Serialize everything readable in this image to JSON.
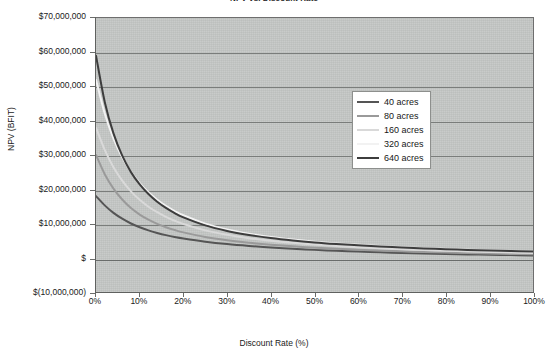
{
  "chart_data": {
    "type": "line",
    "title": "NPV vs. Discount Rate",
    "xlabel": "Discount Rate (%)",
    "ylabel": "NPV (BFIT)",
    "xlim": [
      0,
      100
    ],
    "ylim": [
      -10000000,
      70000000
    ],
    "grid": true,
    "legend_position": "upper-right-inside",
    "x_tick_labels": [
      "0%",
      "10%",
      "20%",
      "30%",
      "40%",
      "50%",
      "60%",
      "70%",
      "80%",
      "90%",
      "100%"
    ],
    "x_ticks": [
      0,
      10,
      20,
      30,
      40,
      50,
      60,
      70,
      80,
      90,
      100
    ],
    "y_tick_labels": [
      "$70,000,000",
      "$60,000,000",
      "$50,000,000",
      "$40,000,000",
      "$30,000,000",
      "$20,000,000",
      "$10,000,000",
      "$",
      "$(10,000,000)"
    ],
    "y_ticks": [
      70000000,
      60000000,
      50000000,
      40000000,
      30000000,
      20000000,
      10000000,
      0,
      -10000000
    ],
    "x": [
      0,
      2,
      4,
      6,
      8,
      10,
      12,
      14,
      16,
      18,
      20,
      25,
      30,
      35,
      40,
      45,
      50,
      55,
      60,
      65,
      70,
      75,
      80,
      85,
      90,
      95,
      100
    ],
    "series": [
      {
        "name": "40 acres",
        "color": "#555555",
        "values": [
          18000000,
          15300000,
          13100000,
          11400000,
          10000000,
          8900000,
          8000000,
          7250000,
          6600000,
          6050000,
          5600000,
          4700000,
          4000000,
          3450000,
          3000000,
          2630000,
          2300000,
          2030000,
          1800000,
          1590000,
          1410000,
          1250000,
          1110000,
          980000,
          870000,
          770000,
          680000
        ]
      },
      {
        "name": "80 acres",
        "color": "#9a9a9a",
        "values": [
          30000000,
          24400000,
          20200000,
          17000000,
          14500000,
          12600000,
          11100000,
          9900000,
          8900000,
          8100000,
          7400000,
          6050000,
          5100000,
          4370000,
          3800000,
          3330000,
          2940000,
          2610000,
          2330000,
          2090000,
          1870000,
          1680000,
          1510000,
          1360000,
          1220000,
          1100000,
          990000
        ]
      },
      {
        "name": "160 acres",
        "color": "#d9d9d9",
        "values": [
          38000000,
          31500000,
          26400000,
          22500000,
          19400000,
          16900000,
          14900000,
          13300000,
          11950000,
          10800000,
          9850000,
          8000000,
          6700000,
          5720000,
          4960000,
          4350000,
          3850000,
          3430000,
          3070000,
          2760000,
          2490000,
          2250000,
          2040000,
          1850000,
          1680000,
          1530000,
          1390000
        ]
      },
      {
        "name": "320 acres",
        "color": "#f2f2f2",
        "values": [
          52000000,
          42100000,
          34800000,
          29300000,
          25100000,
          21800000,
          19100000,
          16950000,
          15150000,
          13650000,
          12400000,
          9950000,
          8250000,
          7000000,
          6050000,
          5300000,
          4690000,
          4190000,
          3770000,
          3410000,
          3090000,
          2810000,
          2570000,
          2350000,
          2150000,
          1970000,
          1810000
        ]
      },
      {
        "name": "640 acres",
        "color": "#3d3d3d",
        "values": [
          59000000,
          45500000,
          36300000,
          29800000,
          25000000,
          21400000,
          18600000,
          16350000,
          14550000,
          13050000,
          11800000,
          9450000,
          7830000,
          6650000,
          5750000,
          5050000,
          4480000,
          4020000,
          3620000,
          3280000,
          2990000,
          2730000,
          2500000,
          2290000,
          2110000,
          1940000,
          1790000
        ]
      }
    ]
  },
  "legend": {
    "items": [
      {
        "label": "40 acres",
        "color": "#555555"
      },
      {
        "label": "80 acres",
        "color": "#9a9a9a"
      },
      {
        "label": "160 acres",
        "color": "#d9d9d9"
      },
      {
        "label": "320 acres",
        "color": "#f2f2f2"
      },
      {
        "label": "640 acres",
        "color": "#3d3d3d"
      }
    ]
  },
  "colors": {
    "plot_background": "#c3c6c4",
    "gridline": "#7a7d7b",
    "axis": "#5f615f",
    "text": "#1a1a1a",
    "page_background": "#ffffff"
  }
}
